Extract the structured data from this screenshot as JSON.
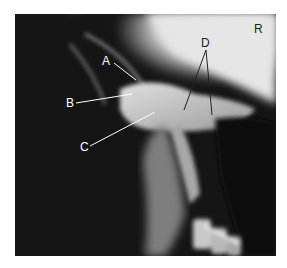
{
  "figure": {
    "type": "radiograph",
    "side_marker": "R",
    "labels": [
      {
        "id": "A",
        "text": "A",
        "x": 107,
        "y": 55,
        "color": "#ffffff",
        "line": [
          [
            114,
            63
          ],
          [
            136,
            80
          ]
        ]
      },
      {
        "id": "B",
        "text": "B",
        "x": 66,
        "y": 98,
        "color": "#ffffff",
        "line": [
          [
            76,
            103
          ],
          [
            132,
            94
          ]
        ]
      },
      {
        "id": "C",
        "text": "C",
        "x": 80,
        "y": 141,
        "color": "#ffffff",
        "line": [
          [
            90,
            146
          ],
          [
            155,
            112
          ]
        ]
      },
      {
        "id": "D",
        "text": "D",
        "x": 201,
        "y": 37,
        "color": "#222222",
        "lines": [
          [
            [
              206,
              50
            ],
            [
              184,
              110
            ]
          ],
          [
            [
              206,
              50
            ],
            [
              212,
              115
            ]
          ]
        ]
      }
    ],
    "colors": {
      "background": "#ffffff",
      "dark_tissue": "#151515",
      "bone": "#cfcfcf",
      "bright_region": "#f0f0f0"
    }
  }
}
